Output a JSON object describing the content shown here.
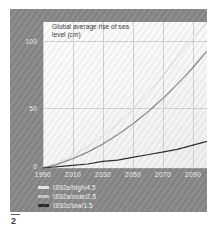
{
  "figure": {
    "page_number": "2",
    "panel_color": "#898989",
    "plot_bg": "#fbfbfb"
  },
  "chart_data": {
    "type": "line",
    "title": "Global average rise of sea level (cm)",
    "xlabel": "",
    "ylabel": "",
    "xlim": [
      1990,
      2100
    ],
    "ylim": [
      0,
      110
    ],
    "xticks": [
      "1990",
      "2010",
      "2030",
      "2050",
      "2070",
      "2090"
    ],
    "yticks": [
      "0",
      "50",
      "100"
    ],
    "grid": true,
    "legend_position": "below-left",
    "x": [
      1990,
      2000,
      2010,
      2020,
      2030,
      2040,
      2050,
      2060,
      2070,
      2080,
      2090,
      2100
    ],
    "series": [
      {
        "name": "IS92e/high/4.5",
        "color": "#e8e8e8",
        "values": [
          0,
          4,
          9,
          16,
          24,
          33,
          44,
          56,
          69,
          83,
          97,
          110
        ]
      },
      {
        "name": "IS92a/note/2.5",
        "color": "#8f8f8f",
        "values": [
          0,
          3,
          7,
          12,
          18,
          25,
          33,
          42,
          52,
          63,
          75,
          88
        ]
      },
      {
        "name": "IS92c/low/1.5",
        "color": "#2b2b2b",
        "values": [
          0,
          1,
          2,
          3,
          5,
          6,
          8,
          10,
          12,
          14,
          17,
          20
        ]
      }
    ]
  }
}
